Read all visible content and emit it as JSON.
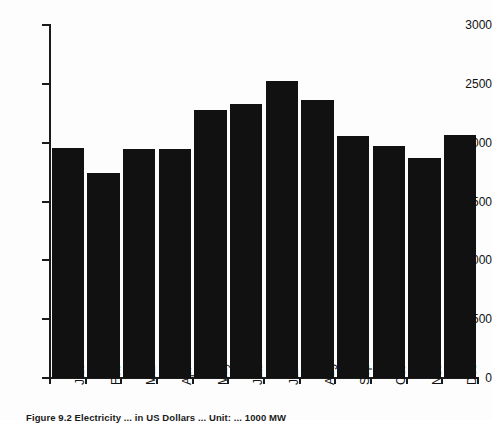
{
  "figure": {
    "caption": "Figure 9.2  Electricity ... in US Dollars ... Unit: ... 1000 MW"
  },
  "chart_data": {
    "type": "bar",
    "title": "",
    "xlabel": "",
    "ylabel": "",
    "categories": [
      "Jan",
      "Feb",
      "Mar",
      "Apr",
      "May",
      "Jun",
      "Jul",
      "Aug",
      "Sep",
      "Oct",
      "Nov",
      "Dec"
    ],
    "values": [
      1955,
      1740,
      1945,
      1945,
      2280,
      2330,
      2525,
      2360,
      2055,
      1970,
      1870,
      2065
    ],
    "ylim": [
      0,
      3000
    ],
    "yticks": [
      0,
      500,
      1000,
      1500,
      2000,
      2500,
      3000
    ],
    "ytick_labels": [
      "0",
      "500",
      "1000",
      "1500",
      "2000",
      "2500",
      "3000"
    ],
    "grid": false,
    "legend": null,
    "bar_color": "#111111",
    "axis_color": "#1a1a1a",
    "background": "#fdfdfd"
  }
}
